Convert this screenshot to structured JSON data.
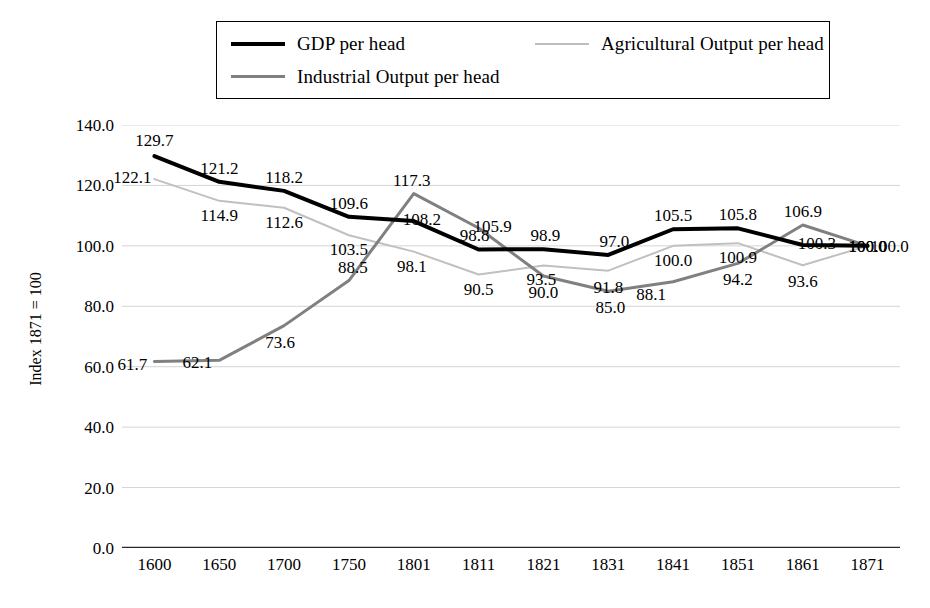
{
  "chart_data": {
    "type": "line",
    "title": "",
    "xlabel": "",
    "ylabel": "Index 1871 = 100",
    "categories": [
      "1600",
      "1650",
      "1700",
      "1750",
      "1801",
      "1811",
      "1821",
      "1831",
      "1841",
      "1851",
      "1861",
      "1871"
    ],
    "ylim": [
      0,
      140
    ],
    "yticks": [
      "0.0",
      "20.0",
      "40.0",
      "60.0",
      "80.0",
      "100.0",
      "120.0",
      "140.0"
    ],
    "ytick_values": [
      0,
      20,
      40,
      60,
      80,
      100,
      120,
      140
    ],
    "grid": true,
    "legend_position": "top",
    "series": [
      {
        "name": "GDP per head",
        "color": "#000000",
        "width": 4,
        "values": [
          129.7,
          121.2,
          118.2,
          109.6,
          108.2,
          98.8,
          98.9,
          97.0,
          105.5,
          105.8,
          100.3,
          100.0
        ],
        "labels": [
          "129.7",
          "121.2",
          "118.2",
          "109.6",
          "108.2",
          "98.8",
          "98.9",
          "97.0",
          "105.5",
          "105.8",
          "100.3",
          "100.0"
        ]
      },
      {
        "name": "Agricultural Output per head",
        "color": "#c0c0c0",
        "width": 2,
        "values": [
          122.1,
          114.9,
          112.6,
          103.5,
          98.1,
          90.5,
          93.5,
          91.8,
          100.0,
          100.9,
          93.6,
          100.0
        ],
        "labels": [
          "122.1",
          "114.9",
          "112.6",
          "103.5",
          "98.1",
          "90.5",
          "93.5",
          "91.8",
          "100.0",
          "100.9",
          "93.6",
          "100.0"
        ]
      },
      {
        "name": "Industrial Output per head",
        "color": "#808080",
        "width": 3,
        "values": [
          61.7,
          62.1,
          73.6,
          88.5,
          117.3,
          105.9,
          90.0,
          85.0,
          88.1,
          94.2,
          106.9,
          100.0
        ],
        "labels": [
          "61.7",
          "62.1",
          "73.6",
          "88.5",
          "117.3",
          "105.9",
          "90.0",
          "85.0",
          "88.1",
          "94.2",
          "106.9",
          "100.0"
        ]
      }
    ],
    "label_offsets": {
      "gdp": [
        [
          0,
          -16
        ],
        [
          0,
          -14
        ],
        [
          0,
          -14
        ],
        [
          0,
          -14
        ],
        [
          8,
          -2
        ],
        [
          -4,
          -14
        ],
        [
          2,
          -14
        ],
        [
          6,
          -14
        ],
        [
          0,
          -14
        ],
        [
          0,
          -14
        ],
        [
          14,
          -2
        ],
        [
          22,
          0
        ]
      ],
      "agri": [
        [
          -22,
          -2
        ],
        [
          0,
          14
        ],
        [
          0,
          14
        ],
        [
          0,
          14
        ],
        [
          -2,
          14
        ],
        [
          0,
          14
        ],
        [
          -2,
          14
        ],
        [
          0,
          16
        ],
        [
          0,
          14
        ],
        [
          0,
          14
        ],
        [
          0,
          16
        ],
        [
          0,
          0
        ]
      ],
      "ind": [
        [
          -22,
          2
        ],
        [
          -22,
          2
        ],
        [
          -4,
          16
        ],
        [
          4,
          -14
        ],
        [
          -2,
          -14
        ],
        [
          14,
          -2
        ],
        [
          0,
          16
        ],
        [
          2,
          16
        ],
        [
          -22,
          12
        ],
        [
          0,
          16
        ],
        [
          0,
          -14
        ],
        [
          0,
          0
        ]
      ]
    }
  },
  "legend": {
    "entries": [
      {
        "label": "GDP per head"
      },
      {
        "label": "Agricultural Output per head"
      },
      {
        "label": "Industrial Output per head"
      }
    ]
  }
}
